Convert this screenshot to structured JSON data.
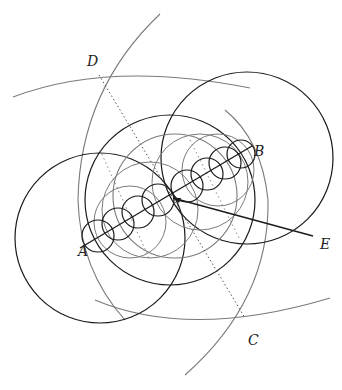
{
  "diagram": {
    "type": "geometric-construction",
    "labels": {
      "A": "A",
      "B": "B",
      "C": "C",
      "D": "D",
      "E": "E"
    },
    "points": {
      "A": [
        87,
        244
      ],
      "B": [
        242,
        152
      ],
      "M": [
        173,
        198
      ],
      "C": [
        245,
        318
      ],
      "D": [
        99,
        75
      ],
      "E": [
        313,
        236
      ]
    },
    "colors": {
      "dark": "#1a1a1a",
      "gray": "#7a7a7a",
      "dotted": "#555555",
      "background": "#ffffff"
    },
    "small_circle_count": 8
  }
}
